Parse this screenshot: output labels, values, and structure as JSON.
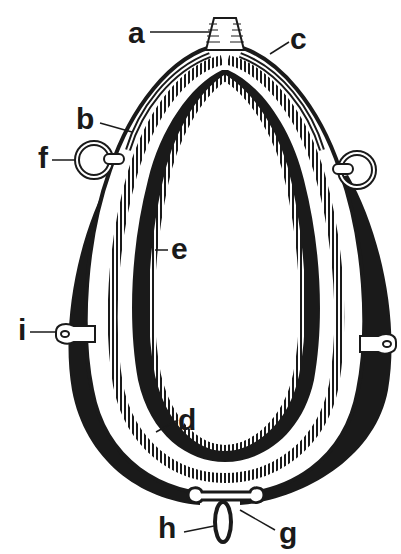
{
  "diagram": {
    "colors": {
      "ink": "#1a1a1a",
      "paper": "#ffffff"
    },
    "labels": [
      {
        "id": "a",
        "text": "a",
        "x": 128,
        "y": 18
      },
      {
        "id": "b",
        "text": "b",
        "x": 76,
        "y": 104
      },
      {
        "id": "c",
        "text": "c",
        "x": 290,
        "y": 24
      },
      {
        "id": "d",
        "text": "d",
        "x": 178,
        "y": 405
      },
      {
        "id": "e",
        "text": "e",
        "x": 171,
        "y": 234
      },
      {
        "id": "f",
        "text": "f",
        "x": 38,
        "y": 143
      },
      {
        "id": "g",
        "text": "g",
        "x": 279,
        "y": 518
      },
      {
        "id": "h",
        "text": "h",
        "x": 158,
        "y": 513
      },
      {
        "id": "i",
        "text": "i",
        "x": 18,
        "y": 315
      }
    ]
  }
}
